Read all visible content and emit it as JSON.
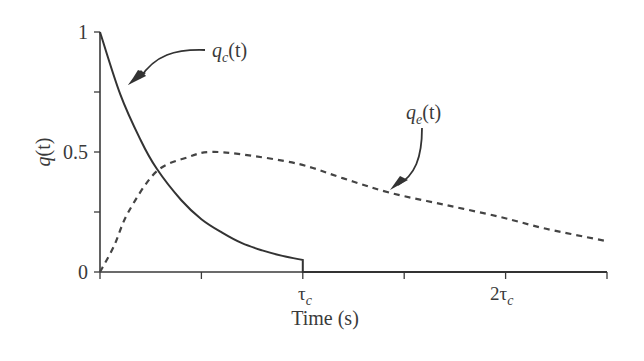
{
  "chart_data": {
    "type": "line",
    "title": "",
    "xlabel": "Time (s)",
    "ylabel": "q(t)",
    "x_unit": "τc",
    "xlim": [
      0,
      2.5
    ],
    "ylim": [
      0,
      1
    ],
    "grid": false,
    "legend": "none (curves labeled with annotation arrows)",
    "x_ticks": [
      0,
      0.5,
      1,
      1.5,
      2,
      2.5
    ],
    "x_tick_labels": [
      {
        "at": 1,
        "label": "τ",
        "sub": "c"
      },
      {
        "at": 2,
        "label": "2τ",
        "sub": "c"
      }
    ],
    "y_ticks": [
      0,
      0.25,
      0.5,
      0.75,
      1
    ],
    "y_tick_labels": [
      {
        "at": 0,
        "label": "0"
      },
      {
        "at": 0.5,
        "label": "0.5"
      },
      {
        "at": 1,
        "label": "1"
      }
    ],
    "series": [
      {
        "name": "q_c(t)",
        "style": "solid",
        "x": [
          0,
          0.1,
          0.2,
          0.28,
          0.4,
          0.5,
          0.6,
          0.7,
          0.8,
          0.9,
          1.0,
          1.0,
          1.5,
          2.0,
          2.5
        ],
        "values": [
          1.0,
          0.74,
          0.55,
          0.43,
          0.3,
          0.22,
          0.165,
          0.12,
          0.09,
          0.067,
          0.05,
          0.0,
          0.0,
          0.0,
          0.0
        ]
      },
      {
        "name": "q_e(t)",
        "style": "dashed",
        "x": [
          0,
          0.07,
          0.14,
          0.28,
          0.44,
          0.54,
          0.7,
          0.98,
          1.2,
          1.43,
          1.7,
          1.97,
          2.2,
          2.49
        ],
        "values": [
          0,
          0.11,
          0.25,
          0.42,
          0.48,
          0.5,
          0.49,
          0.45,
          0.39,
          0.33,
          0.28,
          0.23,
          0.18,
          0.13
        ]
      }
    ],
    "annotations": [
      {
        "text": "q",
        "sub": "c",
        "suffix": "(t)",
        "points_to": "q_c(t) curve near t=0.15τc"
      },
      {
        "text": "q",
        "sub": "e",
        "suffix": "(t)",
        "points_to": "q_e(t) curve near t=1.45τc"
      }
    ]
  },
  "labels": {
    "ylabel_main": "q",
    "ylabel_suffix": "(t)",
    "xlabel": "Time (s)",
    "y0": "0",
    "y05": "0.5",
    "y1": "1",
    "tau": "τ",
    "two_tau": "2τ",
    "sub_c": "c",
    "sub_e": "e",
    "ann_q": "q",
    "ann_t": "(t)"
  }
}
